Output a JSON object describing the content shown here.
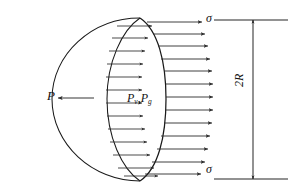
{
  "figure": {
    "background": "#ffffff",
    "stroke_color": "#1a1a1a",
    "arrow_color": "#2b2b2b"
  },
  "labels": {
    "external_force": "P",
    "internal_pressure_v": "P",
    "internal_pressure_v_sub": "v",
    "internal_pressure_separator": ",",
    "internal_pressure_g": "P",
    "internal_pressure_g_sub": "g",
    "stress_top": "σ",
    "stress_bottom": "σ",
    "diameter": "2R"
  },
  "geometry": {
    "hemisphere_left_x": 52,
    "hemisphere_right_x": 166,
    "hemisphere_top_y": 18,
    "hemisphere_bottom_y": 181,
    "rim_center_x": 140,
    "rim_rx": 33,
    "rim_ry": 82,
    "dimension_line_x": 253,
    "dimension_top_y": 20,
    "dimension_bottom_y": 179,
    "extension_left_x": 214,
    "extension_right_x": 288
  },
  "arrows": {
    "inner_count": 13,
    "inner_name": "internal-pressure-arrow",
    "outer_count": 13,
    "outer_name": "surface-stress-arrow",
    "external_name": "external-force-arrow",
    "inner_arrows": [
      {
        "y": 26,
        "x1": 117,
        "x2": 152
      },
      {
        "y": 38,
        "x1": 112,
        "x2": 148
      },
      {
        "y": 51,
        "x1": 109,
        "x2": 145
      },
      {
        "y": 64,
        "x1": 107,
        "x2": 143
      },
      {
        "y": 77,
        "x1": 106,
        "x2": 142
      },
      {
        "y": 90,
        "x1": 106,
        "x2": 142
      },
      {
        "y": 103,
        "x1": 106,
        "x2": 142
      },
      {
        "y": 116,
        "x1": 107,
        "x2": 143
      },
      {
        "y": 129,
        "x1": 108,
        "x2": 145
      },
      {
        "y": 142,
        "x1": 110,
        "x2": 147
      },
      {
        "y": 155,
        "x1": 113,
        "x2": 150
      },
      {
        "y": 168,
        "x1": 118,
        "x2": 154
      },
      {
        "y": 176,
        "x1": 124,
        "x2": 158
      }
    ],
    "outer_arrows": [
      {
        "y": 22,
        "x1": 147,
        "x2": 202
      },
      {
        "y": 34,
        "x1": 153,
        "x2": 205
      },
      {
        "y": 46,
        "x1": 158,
        "x2": 208
      },
      {
        "y": 59,
        "x1": 161,
        "x2": 210
      },
      {
        "y": 71,
        "x1": 164,
        "x2": 212
      },
      {
        "y": 84,
        "x1": 166,
        "x2": 213
      },
      {
        "y": 97,
        "x1": 166,
        "x2": 213
      },
      {
        "y": 110,
        "x1": 166,
        "x2": 213
      },
      {
        "y": 123,
        "x1": 164,
        "x2": 212
      },
      {
        "y": 136,
        "x1": 161,
        "x2": 210
      },
      {
        "y": 149,
        "x1": 157,
        "x2": 208
      },
      {
        "y": 162,
        "x1": 152,
        "x2": 205
      },
      {
        "y": 174,
        "x1": 145,
        "x2": 201
      }
    ],
    "external_arrow": {
      "y": 98,
      "x1": 94,
      "x2": 58
    }
  }
}
